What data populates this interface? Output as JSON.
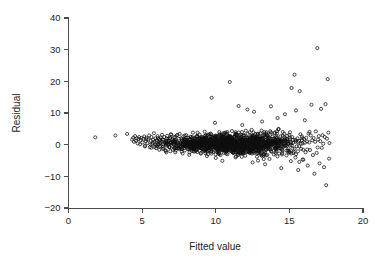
{
  "chart_data": {
    "type": "scatter",
    "title": "",
    "xlabel": "Fitted value",
    "ylabel": "Residual",
    "xlim": [
      0,
      20
    ],
    "ylim": [
      -20,
      40
    ],
    "xticks": [
      0,
      5,
      10,
      15,
      20
    ],
    "yticks": [
      -20,
      -10,
      0,
      10,
      20,
      30,
      40
    ],
    "xtick_labels": [
      "0",
      "5",
      "10",
      "15",
      "20"
    ],
    "ytick_labels": [
      "−20",
      "−10",
      "0",
      "10",
      "20",
      "30",
      "40"
    ],
    "grid": false,
    "legend": null,
    "marker": "open-circle",
    "marker_color": "#0d0d0d",
    "marker_size": 3.1,
    "n_points": 1400,
    "series": [
      {
        "name": "residuals",
        "points": [
          [
            1.82,
            2.3
          ],
          [
            3.18,
            2.9
          ],
          [
            3.98,
            3.4
          ],
          [
            4.32,
            1.6
          ],
          [
            4.4,
            2.2
          ],
          [
            4.45,
            0.9
          ],
          [
            4.52,
            2.7
          ],
          [
            4.58,
            1.2
          ],
          [
            4.63,
            2.0
          ],
          [
            4.7,
            0.4
          ],
          [
            4.75,
            1.8
          ],
          [
            4.8,
            2.4
          ],
          [
            4.86,
            0.1
          ],
          [
            4.9,
            1.4
          ],
          [
            4.95,
            2.1
          ],
          [
            5.02,
            0.7
          ],
          [
            5.08,
            1.9
          ],
          [
            5.14,
            2.6
          ],
          [
            5.2,
            -0.3
          ],
          [
            5.25,
            1.1
          ],
          [
            5.3,
            2.2
          ],
          [
            5.36,
            0.5
          ],
          [
            5.42,
            1.7
          ],
          [
            5.48,
            2.9
          ],
          [
            5.52,
            -0.8
          ],
          [
            5.58,
            1.3
          ],
          [
            5.63,
            2.4
          ],
          [
            5.68,
            0.2
          ],
          [
            5.74,
            1.6
          ],
          [
            5.8,
            3.6
          ],
          [
            5.84,
            0.9
          ],
          [
            5.9,
            2.0
          ],
          [
            5.95,
            -1.1
          ],
          [
            6.0,
            1.4
          ],
          [
            6.05,
            2.7
          ],
          [
            6.1,
            0.3
          ],
          [
            6.16,
            1.8
          ],
          [
            6.2,
            -0.6
          ],
          [
            6.26,
            2.2
          ],
          [
            6.3,
            1.0
          ],
          [
            6.35,
            3.1
          ],
          [
            6.4,
            -1.4
          ],
          [
            6.45,
            1.5
          ],
          [
            6.5,
            2.4
          ],
          [
            6.55,
            0.6
          ],
          [
            6.6,
            -2.0
          ],
          [
            6.66,
            1.9
          ],
          [
            6.7,
            2.8
          ],
          [
            6.76,
            0.1
          ],
          [
            6.8,
            1.2
          ],
          [
            6.86,
            -0.9
          ],
          [
            6.9,
            2.1
          ],
          [
            6.95,
            3.3
          ],
          [
            7.0,
            0.5
          ],
          [
            7.05,
            1.7
          ],
          [
            7.1,
            -1.6
          ],
          [
            7.16,
            2.3
          ],
          [
            7.2,
            0.8
          ],
          [
            7.25,
            -2.4
          ],
          [
            7.3,
            1.4
          ],
          [
            7.35,
            2.9
          ],
          [
            7.4,
            0.2
          ],
          [
            7.46,
            -1.2
          ],
          [
            7.5,
            1.9
          ],
          [
            7.55,
            3.4
          ],
          [
            7.6,
            -0.4
          ],
          [
            7.65,
            2.0
          ],
          [
            7.7,
            1.1
          ],
          [
            7.75,
            -2.8
          ],
          [
            7.8,
            2.6
          ],
          [
            7.85,
            0.7
          ],
          [
            7.9,
            -1.8
          ],
          [
            7.95,
            1.5
          ],
          [
            8.0,
            3.0
          ],
          [
            8.05,
            -0.2
          ],
          [
            8.1,
            2.2
          ],
          [
            8.15,
            0.9
          ],
          [
            8.2,
            -3.2
          ],
          [
            8.25,
            1.7
          ],
          [
            8.3,
            2.5
          ],
          [
            8.35,
            -1.0
          ],
          [
            8.4,
            0.4
          ],
          [
            8.45,
            3.8
          ],
          [
            8.5,
            1.3
          ],
          [
            8.55,
            -2.2
          ],
          [
            8.6,
            2.0
          ],
          [
            8.65,
            0.6
          ],
          [
            8.7,
            -1.5
          ],
          [
            8.75,
            2.8
          ],
          [
            8.8,
            1.1
          ],
          [
            8.85,
            -0.7
          ],
          [
            8.9,
            3.2
          ],
          [
            8.95,
            1.8
          ],
          [
            9.0,
            -2.6
          ],
          [
            9.05,
            0.3
          ],
          [
            9.1,
            2.4
          ],
          [
            9.15,
            1.2
          ],
          [
            9.2,
            -1.9
          ],
          [
            9.25,
            4.1
          ],
          [
            9.3,
            0.8
          ],
          [
            9.35,
            2.1
          ],
          [
            9.4,
            -3.6
          ],
          [
            9.45,
            1.6
          ],
          [
            9.5,
            2.9
          ],
          [
            9.55,
            -0.5
          ],
          [
            9.6,
            1.0
          ],
          [
            9.65,
            3.5
          ],
          [
            9.7,
            -2.1
          ],
          [
            9.72,
            14.8
          ],
          [
            9.75,
            2.3
          ],
          [
            9.8,
            0.7
          ],
          [
            9.85,
            -1.3
          ],
          [
            9.9,
            1.9
          ],
          [
            9.95,
            6.9
          ],
          [
            10.0,
            -4.2
          ],
          [
            10.05,
            2.6
          ],
          [
            10.1,
            0.2
          ],
          [
            10.15,
            1.4
          ],
          [
            10.2,
            -2.9
          ],
          [
            10.25,
            3.1
          ],
          [
            10.3,
            1.7
          ],
          [
            10.35,
            -0.8
          ],
          [
            10.4,
            2.2
          ],
          [
            10.45,
            -5.1
          ],
          [
            10.5,
            0.9
          ],
          [
            10.55,
            1.5
          ],
          [
            10.6,
            3.7
          ],
          [
            10.65,
            -1.7
          ],
          [
            10.7,
            2.0
          ],
          [
            10.75,
            0.4
          ],
          [
            10.8,
            -3.0
          ],
          [
            10.85,
            1.2
          ],
          [
            10.9,
            2.7
          ],
          [
            10.95,
            19.8
          ],
          [
            11.0,
            -0.6
          ],
          [
            11.05,
            1.8
          ],
          [
            11.1,
            4.3
          ],
          [
            11.15,
            -2.3
          ],
          [
            11.2,
            0.5
          ],
          [
            11.25,
            2.5
          ],
          [
            11.3,
            1.1
          ],
          [
            11.35,
            -4.0
          ],
          [
            11.4,
            3.3
          ],
          [
            11.45,
            1.9
          ],
          [
            11.5,
            -1.1
          ],
          [
            11.55,
            12.2
          ],
          [
            11.6,
            0.8
          ],
          [
            11.65,
            2.1
          ],
          [
            11.7,
            -2.7
          ],
          [
            11.75,
            1.6
          ],
          [
            11.8,
            6.2
          ],
          [
            11.85,
            -0.3
          ],
          [
            11.9,
            2.8
          ],
          [
            11.95,
            1.3
          ],
          [
            12.0,
            -3.5
          ],
          [
            12.05,
            0.6
          ],
          [
            12.1,
            2.3
          ],
          [
            12.15,
            11.1
          ],
          [
            12.2,
            -1.4
          ],
          [
            12.25,
            1.7
          ],
          [
            12.3,
            3.9
          ],
          [
            12.35,
            -2.0
          ],
          [
            12.4,
            0.9
          ],
          [
            12.45,
            2.4
          ],
          [
            12.5,
            -5.6
          ],
          [
            12.55,
            1.2
          ],
          [
            12.6,
            10.4
          ],
          [
            12.65,
            -0.9
          ],
          [
            12.7,
            2.0
          ],
          [
            12.75,
            1.5
          ],
          [
            12.8,
            -3.8
          ],
          [
            12.85,
            3.2
          ],
          [
            12.9,
            0.3
          ],
          [
            12.95,
            -1.8
          ],
          [
            13.0,
            2.6
          ],
          [
            13.05,
            1.0
          ],
          [
            13.1,
            -2.5
          ],
          [
            13.15,
            7.3
          ],
          [
            13.2,
            1.8
          ],
          [
            13.25,
            -0.4
          ],
          [
            13.3,
            2.9
          ],
          [
            13.35,
            -6.2
          ],
          [
            13.4,
            1.4
          ],
          [
            13.45,
            3.4
          ],
          [
            13.5,
            -1.2
          ],
          [
            13.55,
            0.7
          ],
          [
            13.6,
            2.2
          ],
          [
            13.65,
            -4.5
          ],
          [
            13.7,
            1.9
          ],
          [
            13.75,
            12.1
          ],
          [
            13.8,
            -0.1
          ],
          [
            13.85,
            2.5
          ],
          [
            13.9,
            1.1
          ],
          [
            13.95,
            -3.1
          ],
          [
            14.0,
            3.6
          ],
          [
            14.05,
            0.5
          ],
          [
            14.1,
            -1.6
          ],
          [
            14.15,
            2.1
          ],
          [
            14.2,
            8.4
          ],
          [
            14.25,
            1.6
          ],
          [
            14.3,
            -2.8
          ],
          [
            14.35,
            0.8
          ],
          [
            14.4,
            2.7
          ],
          [
            14.45,
            -7.4
          ],
          [
            14.5,
            1.3
          ],
          [
            14.55,
            4.0
          ],
          [
            14.6,
            -0.7
          ],
          [
            14.65,
            2.3
          ],
          [
            14.7,
            9.6
          ],
          [
            14.75,
            1.0
          ],
          [
            14.8,
            -3.4
          ],
          [
            14.85,
            2.8
          ],
          [
            14.9,
            0.2
          ],
          [
            14.95,
            -1.9
          ],
          [
            15.0,
            3.1
          ],
          [
            15.05,
            1.7
          ],
          [
            15.1,
            -5.2
          ],
          [
            15.15,
            17.9
          ],
          [
            15.2,
            2.4
          ],
          [
            15.25,
            0.6
          ],
          [
            15.3,
            -2.2
          ],
          [
            15.35,
            22.1
          ],
          [
            15.4,
            1.5
          ],
          [
            15.45,
            10.8
          ],
          [
            15.5,
            -0.5
          ],
          [
            15.55,
            2.0
          ],
          [
            15.6,
            -8.0
          ],
          [
            15.65,
            1.2
          ],
          [
            15.7,
            16.9
          ],
          [
            15.75,
            3.3
          ],
          [
            15.8,
            -1.3
          ],
          [
            15.85,
            2.6
          ],
          [
            15.9,
            0.4
          ],
          [
            15.95,
            -4.8
          ],
          [
            16.0,
            1.8
          ],
          [
            16.05,
            7.7
          ],
          [
            16.1,
            -2.4
          ],
          [
            16.15,
            2.2
          ],
          [
            16.2,
            1.0
          ],
          [
            16.25,
            -6.6
          ],
          [
            16.3,
            3.5
          ],
          [
            16.35,
            0.7
          ],
          [
            16.4,
            -1.7
          ],
          [
            16.45,
            2.9
          ],
          [
            16.5,
            12.6
          ],
          [
            16.55,
            1.4
          ],
          [
            16.6,
            -3.3
          ],
          [
            16.65,
            2.1
          ],
          [
            16.7,
            -9.2
          ],
          [
            16.75,
            0.9
          ],
          [
            16.8,
            4.2
          ],
          [
            16.85,
            -2.6
          ],
          [
            16.9,
            30.5
          ],
          [
            16.95,
            1.6
          ],
          [
            17.0,
            2.7
          ],
          [
            17.05,
            -5.9
          ],
          [
            17.1,
            1.1
          ],
          [
            17.15,
            11.3
          ],
          [
            17.2,
            -1.0
          ],
          [
            17.25,
            3.0
          ],
          [
            17.3,
            0.3
          ],
          [
            17.35,
            -7.1
          ],
          [
            17.4,
            2.4
          ],
          [
            17.45,
            12.8
          ],
          [
            17.5,
            -12.8
          ],
          [
            17.55,
            1.9
          ],
          [
            17.6,
            20.7
          ],
          [
            17.65,
            3.8
          ],
          [
            17.7,
            -4.4
          ],
          [
            17.72,
            0.5
          ]
        ]
      }
    ]
  },
  "axes": {
    "x_title": "Fitted value",
    "y_title": "Residual"
  }
}
